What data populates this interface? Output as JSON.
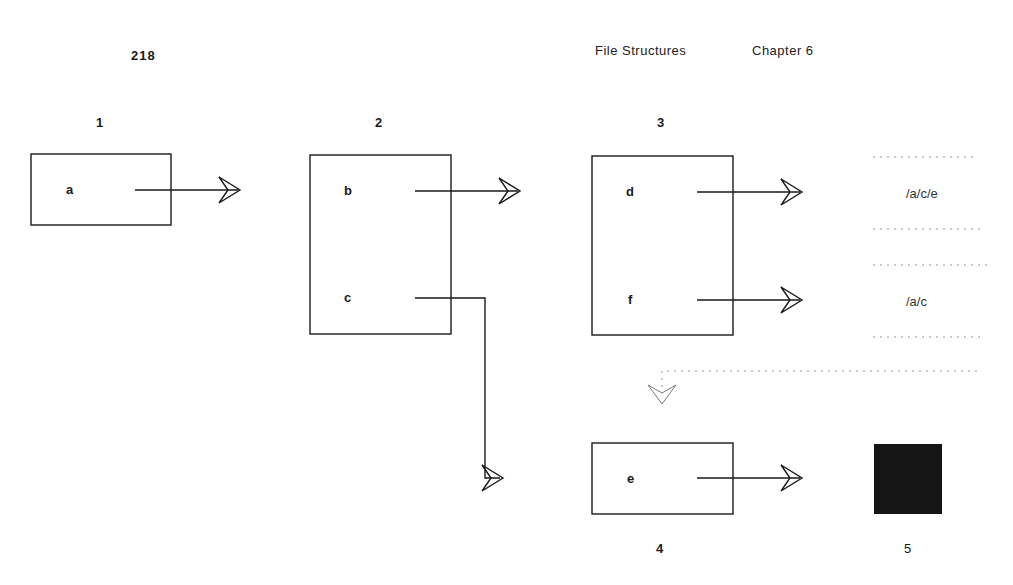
{
  "header": {
    "page_number": "218",
    "book_title": "File Structures",
    "chapter": "Chapter 6"
  },
  "diagram": {
    "nodes": [
      {
        "id": "1",
        "number": "1",
        "entries": [
          "a"
        ]
      },
      {
        "id": "2",
        "number": "2",
        "entries": [
          "b",
          "c"
        ]
      },
      {
        "id": "3",
        "number": "3",
        "entries": [
          "d",
          "f"
        ]
      },
      {
        "id": "4",
        "number": "4",
        "entries": [
          "e"
        ]
      },
      {
        "id": "5",
        "number": "5",
        "entries": []
      }
    ],
    "path_labels": [
      "/a/c/e",
      "/a/c"
    ],
    "edges": [
      {
        "from": "1.a",
        "to": "2"
      },
      {
        "from": "2.b",
        "to": "3"
      },
      {
        "from": "2.c",
        "to": "4"
      },
      {
        "from": "3.d",
        "to": "/a/c/e"
      },
      {
        "from": "3.f",
        "to": "/a/c"
      },
      {
        "from": "/a/c",
        "to": "4",
        "style": "dotted"
      },
      {
        "from": "4.e",
        "to": "5"
      }
    ],
    "colors": {
      "line": "#1a1a1a",
      "dotted": "#9a9a9a",
      "filled_block": "#151515"
    }
  }
}
